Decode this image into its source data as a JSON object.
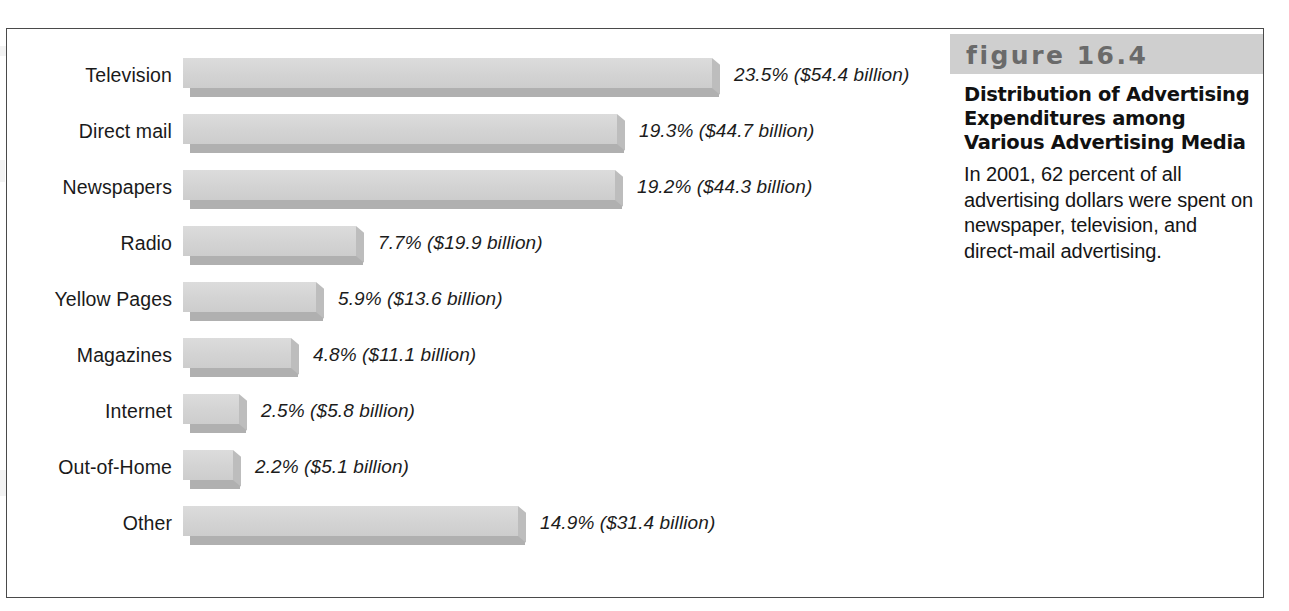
{
  "figure": {
    "banner_label": "figure 16.4",
    "title": "Distribution of Advertising Expenditures among Various Advertising Media",
    "body": "In 2001, 62 percent of all advertising dollars were spent on newspaper, television, and direct-mail advertising."
  },
  "colors": {
    "bar_face": "#d3d3d3",
    "bar_shadow": "#b0b0b0",
    "bar_side": "#bdbdbd",
    "banner_bg": "#cfcfcf",
    "banner_text": "#6a6a6a",
    "frame": "#4a4a4a",
    "text": "#1a1a1a"
  },
  "chart_data": {
    "type": "bar",
    "orientation": "horizontal",
    "title": "Distribution of Advertising Expenditures among Various Advertising Media",
    "xlabel": "",
    "ylabel": "",
    "grid": false,
    "legend": "none",
    "axis_visible": false,
    "units": "percent of total advertising expenditures",
    "value_units": "billions of US dollars",
    "year": 2001,
    "xlim": [
      0,
      23.5
    ],
    "categories": [
      "Television",
      "Direct mail",
      "Newspapers",
      "Radio",
      "Yellow Pages",
      "Magazines",
      "Internet",
      "Out-of-Home",
      "Other"
    ],
    "values": [
      23.5,
      19.3,
      19.2,
      7.7,
      5.9,
      4.8,
      2.5,
      2.2,
      14.9
    ],
    "dollars": [
      54.4,
      44.7,
      44.3,
      19.9,
      13.6,
      11.1,
      5.8,
      5.1,
      31.4
    ],
    "data_labels": [
      "23.5% ($54.4 billion)",
      "19.3% ($44.7 billion)",
      "19.2% ($44.3 billion)",
      "7.7% ($19.9 billion)",
      "5.9% ($13.6 billion)",
      "4.8% ($11.1 billion)",
      "2.5% ($5.8 billion)",
      "2.2% ($5.1 billion)",
      "14.9% ($31.4 billion)"
    ]
  }
}
